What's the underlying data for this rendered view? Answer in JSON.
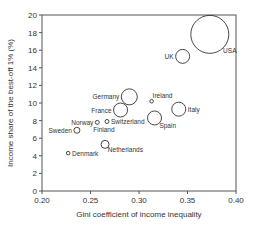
{
  "chart_data": {
    "type": "scatter",
    "subtype": "bubble",
    "title": "",
    "xlabel": "Gini coefficient of income inequality",
    "ylabel": "Income share of the best-off 1% (%)",
    "xlim": [
      0.2,
      0.4
    ],
    "ylim": [
      0,
      20
    ],
    "xticks": [
      "0.20",
      "0.25",
      "0.30",
      "0.35",
      "0.40"
    ],
    "yticks": [
      "0",
      "2",
      "4",
      "6",
      "8",
      "10",
      "12",
      "14",
      "16",
      "18",
      "20"
    ],
    "grid": false,
    "legend": "none",
    "points": [
      {
        "label": "USA",
        "x": 0.373,
        "y": 17.8,
        "size": 19,
        "label_pos": "below-right"
      },
      {
        "label": "UK",
        "x": 0.345,
        "y": 15.3,
        "size": 7,
        "label_pos": "left"
      },
      {
        "label": "Germany",
        "x": 0.29,
        "y": 10.7,
        "size": 8,
        "label_pos": "left"
      },
      {
        "label": "Ireland",
        "x": 0.313,
        "y": 10.2,
        "size": 1.8,
        "label_pos": "above-right"
      },
      {
        "label": "France",
        "x": 0.281,
        "y": 9.2,
        "size": 7,
        "label_pos": "left"
      },
      {
        "label": "Italy",
        "x": 0.341,
        "y": 9.3,
        "size": 7,
        "label_pos": "right"
      },
      {
        "label": "Spain",
        "x": 0.316,
        "y": 8.3,
        "size": 7,
        "label_pos": "below-right"
      },
      {
        "label": "Norway",
        "x": 0.257,
        "y": 7.8,
        "size": 2,
        "label_pos": "left"
      },
      {
        "label": "Switzerland",
        "x": 0.267,
        "y": 7.9,
        "size": 2,
        "label_pos": "right"
      },
      {
        "label": "Finland",
        "x": 0.257,
        "y": 7.8,
        "size": 0,
        "label_pos": "below"
      },
      {
        "label": "Sweden",
        "x": 0.236,
        "y": 6.9,
        "size": 3,
        "label_pos": "left"
      },
      {
        "label": "Netherlands",
        "x": 0.265,
        "y": 5.3,
        "size": 4,
        "label_pos": "below-right"
      },
      {
        "label": "Denmark",
        "x": 0.227,
        "y": 4.3,
        "size": 1.8,
        "label_pos": "right"
      }
    ]
  }
}
